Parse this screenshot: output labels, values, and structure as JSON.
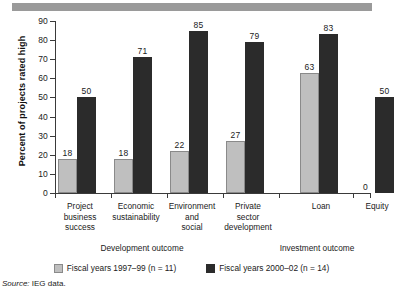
{
  "figure": {
    "source_label": "Source:",
    "source_text": "IEG data."
  },
  "chart_data": {
    "type": "bar",
    "title": "",
    "xlabel": "",
    "ylabel": "Percent of projects rated high",
    "ylim": [
      0,
      90
    ],
    "yticks": [
      0,
      10,
      20,
      30,
      40,
      50,
      60,
      70,
      80,
      90
    ],
    "grid": false,
    "legend_position": "bottom",
    "categories": [
      "Project business success",
      "Economic sustainability",
      "Environment and social",
      "Private sector development",
      "Loan",
      "Equity"
    ],
    "category_lines": [
      [
        "Project",
        "business",
        "success"
      ],
      [
        "Economic",
        "sustainability"
      ],
      [
        "Environment",
        "and",
        "social"
      ],
      [
        "Private",
        "sector",
        "development"
      ],
      [
        "Loan"
      ],
      [
        "Equity"
      ]
    ],
    "series": [
      {
        "name": "Fiscal years 1997–99 (n = 11)",
        "color": "#bfbfbf",
        "values": [
          18,
          18,
          22,
          27,
          63,
          0
        ]
      },
      {
        "name": "Fiscal years 2000–02 (n = 14)",
        "color": "#2b2b2b",
        "values": [
          50,
          71,
          85,
          79,
          83,
          50
        ]
      }
    ],
    "groups": [
      {
        "label": "Development outcome",
        "categories": [
          0,
          1,
          2,
          3
        ]
      },
      {
        "label": "Investment outcome",
        "categories": [
          4,
          5
        ]
      }
    ]
  }
}
